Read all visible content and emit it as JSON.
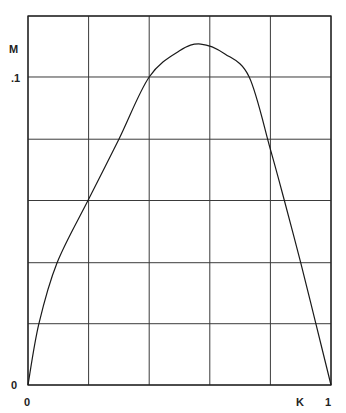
{
  "chart_data": {
    "type": "line",
    "title": "",
    "xlabel": "K",
    "ylabel": "M",
    "xlim": [
      0,
      1
    ],
    "ylim": [
      0,
      0.1198
    ],
    "grid": true,
    "x_gridlines": [
      0,
      0.2,
      0.4,
      0.6,
      0.8,
      1.0
    ],
    "y_gridlines": [
      0,
      0.0199,
      0.0397,
      0.0599,
      0.0798,
      0.1,
      0.1198
    ],
    "x_tick_labels": [
      {
        "value": 0,
        "label": "0"
      },
      {
        "value": 1,
        "label": "1"
      }
    ],
    "y_tick_labels": [
      {
        "value": 0,
        "label": "0"
      },
      {
        "value": 0.1,
        "label": ".1"
      }
    ],
    "series": [
      {
        "name": "M(K)",
        "x": [
          0,
          0.036,
          0.096,
          0.2,
          0.3,
          0.4,
          0.5,
          0.57,
          0.65,
          0.73,
          0.8,
          0.845,
          0.9,
          0.95,
          1.0
        ],
        "y": [
          0,
          0.0199,
          0.0397,
          0.0603,
          0.0798,
          0.1,
          0.1085,
          0.1107,
          0.1075,
          0.1,
          0.0765,
          0.0603,
          0.0397,
          0.0199,
          0
        ]
      }
    ]
  }
}
